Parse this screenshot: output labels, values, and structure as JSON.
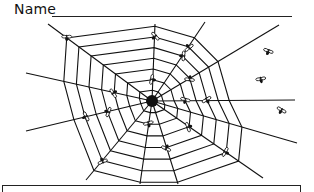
{
  "worksheet": {
    "name_label": "Name",
    "name_value": "",
    "answer_box_text": ""
  },
  "illustration": {
    "subject": "spider web with flies",
    "rings": 7,
    "spokes": 12,
    "flies_on_web": 16,
    "flies_free": 3,
    "ink_color": "#111111",
    "background_color": "#ffffff"
  }
}
